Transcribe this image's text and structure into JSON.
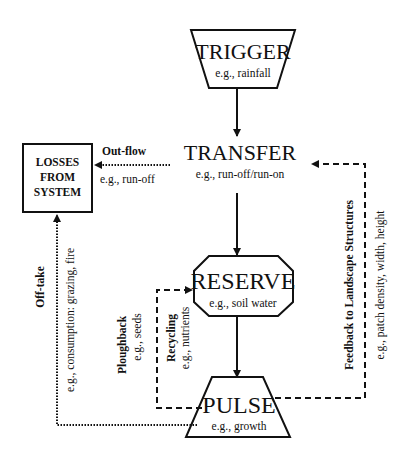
{
  "colors": {
    "ink": "#111111",
    "background": "#ffffff"
  },
  "nodes": {
    "trigger": {
      "title": "TRIGGER",
      "example": "e.g., rainfall"
    },
    "transfer": {
      "title": "TRANSFER",
      "example": "e.g., run-off/run-on"
    },
    "reserve": {
      "title": "RESERVE",
      "example": "e.g., soil water"
    },
    "pulse": {
      "title": "PULSE",
      "example": "e.g., growth"
    },
    "losses": {
      "line1": "LOSSES",
      "line2": "FROM",
      "line3": "SYSTEM"
    }
  },
  "flows": {
    "outflow": {
      "label": "Out-flow",
      "example": "e.g., run-off"
    },
    "offtake": {
      "label": "Off-take",
      "example": "e.g., consumption: grazing, fire"
    },
    "ploughback": {
      "label": "Ploughback",
      "example": "e.g., seeds"
    },
    "recycling": {
      "label": "Recycling",
      "example": "e.g., nutrients"
    },
    "feedback": {
      "label": "Feedback to Landscape Structures",
      "example": "e.g., patch density, width, height"
    }
  }
}
